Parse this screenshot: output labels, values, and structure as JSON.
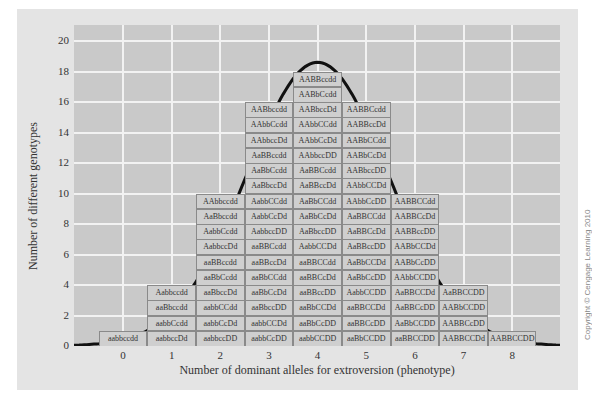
{
  "chart_data": {
    "type": "bar",
    "title": "",
    "xlabel": "Number of dominant alleles for extroversion (phenotype)",
    "ylabel": "Number of different genotypes",
    "categories": [
      "0",
      "1",
      "2",
      "3",
      "4",
      "5",
      "6",
      "7",
      "8"
    ],
    "values": [
      1,
      4,
      10,
      16,
      19,
      16,
      10,
      4,
      1
    ],
    "ylim": [
      0,
      20
    ],
    "yticks": [
      "0",
      "2",
      "4",
      "6",
      "8",
      "10",
      "12",
      "14",
      "16",
      "18",
      "20"
    ],
    "grid": true,
    "legend": null,
    "overlay": "normal distribution curve",
    "genotypes": [
      [
        "aabbccdd"
      ],
      [
        "aabbccDd",
        "aabbCcdd",
        "aaBbccdd",
        "Aabbccdd"
      ],
      [
        "aabbccDD",
        "aabbCcDd",
        "aabbCCdd",
        "aaBbccDd",
        "aaBbCcdd",
        "aaBBccdd",
        "AabbccDd",
        "AabbCcdd",
        "AaBbccdd",
        "AAbbccdd"
      ],
      [
        "aabbCcDD",
        "aabbCCDd",
        "aaBbccDD",
        "aaBbCcDd",
        "aaBbCCdd",
        "aaBBccDd",
        "aaBBCcdd",
        "AabbccDD",
        "AabbCcDd",
        "AabbCCdd",
        "AaBbccDd",
        "AaBbCcdd",
        "AaBBccdd",
        "AAbbccDd",
        "AAbbCcdd",
        "AABbccdd"
      ],
      [
        "aabbCCDD",
        "aaBbCcDD",
        "aaBbCCDd",
        "aaBBccDD",
        "aaBBCcDd",
        "aaBBCCdd",
        "AabbCCDd",
        "AaBbccDD",
        "AaBbCcDd",
        "AaBbCCdd",
        "AaBBccDd",
        "AaBBCcdd",
        "AAbbccDD",
        "AAbbCcDd",
        "AAbbCCdd",
        "AABbccDd",
        "AABbCcdd",
        "AABBccdd"
      ],
      [
        "aaBbCCDD",
        "aaBBCcDD",
        "aaBBCCDd",
        "AabbCCDD",
        "AaBbCcDD",
        "AaBbCCDd",
        "AaBBccDD",
        "AaBBCcDd",
        "AaBBCCdd",
        "AAbbCcDD",
        "AAbbCCDd",
        "AABbccDD",
        "AABbCcDd",
        "AABbCCdd",
        "AABBccDd",
        "AABBCcdd"
      ],
      [
        "aaBBCCDD",
        "AaBbCCDD",
        "AaBBCcDD",
        "AaBBCCDd",
        "AAbbCCDD",
        "AABbCcDD",
        "AABbCCDd",
        "AABBccDD",
        "AABBCcDd",
        "AABBCCdd"
      ],
      [
        "AABBCCDd",
        "AABBCcDD",
        "AABbCCDD",
        "AaBBCCDD"
      ],
      [
        "AABBCCDD"
      ]
    ]
  },
  "axes": {
    "x_label": "Number of dominant alleles for extroversion (phenotype)",
    "y_label": "Number of different genotypes"
  },
  "credit": "Copyright © Cengage Learning 2010",
  "colors": {
    "background": "#ffffff",
    "panel": "#e4e4e4",
    "plot": "#c9c9c9",
    "grid": "#f2f2f2",
    "box": "#cfcfcf",
    "box_border": "#8a8a8a",
    "curve": "#111111"
  }
}
